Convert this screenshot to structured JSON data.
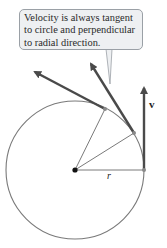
{
  "callout": {
    "lines": [
      "Velocity is always tangent",
      "to circle and perpendicular",
      "to radial direction."
    ]
  },
  "labels": {
    "velocity": "v",
    "radius": "r"
  },
  "colors": {
    "circle": "#7a7a7a",
    "radial_lines": "#7a7a7a",
    "velocity_arrows": "#4a4a4a",
    "center_dot": "#111111",
    "callout_fill": "#eef0f2",
    "callout_border": "#9aa0a6"
  },
  "geometry": {
    "center": [
      75,
      170
    ],
    "radius": 69,
    "points_on_circle": [
      [
        144,
        170
      ],
      [
        134,
        133
      ],
      [
        105,
        109
      ]
    ],
    "arrow_tips": [
      [
        144,
        84
      ],
      [
        89,
        61
      ],
      [
        32,
        70
      ]
    ]
  }
}
